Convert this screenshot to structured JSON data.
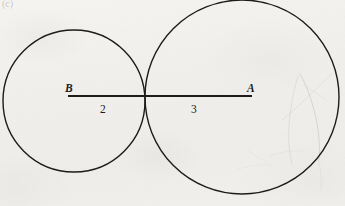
{
  "figure": {
    "corner_mark": "(c)",
    "background_color": "#f3f2ef",
    "ink_color": "#1c1c1c",
    "labels": {
      "point_b": "B",
      "point_a": "A",
      "length_left": "2",
      "length_right": "3"
    }
  },
  "chart_data": {
    "type": "diagram",
    "xlabel": "",
    "ylabel": "",
    "units": "pixels",
    "canvas": {
      "width": 345,
      "height": 206
    },
    "grid": false,
    "legend": null,
    "shapes": [
      {
        "name": "left-circle",
        "kind": "circle",
        "center": [
          74,
          101
        ],
        "radius": 71,
        "stroke": "#1c1c1c",
        "stroke_width": 1.4,
        "fill": "none",
        "label": "B",
        "labeled_radius_value": 2
      },
      {
        "name": "right-circle",
        "kind": "circle",
        "center": [
          242,
          97
        ],
        "radius": 97,
        "stroke": "#1c1c1c",
        "stroke_width": 1.4,
        "fill": "none",
        "label": "A",
        "labeled_radius_value": 3
      },
      {
        "name": "center-segment",
        "kind": "line",
        "from": [
          68,
          96
        ],
        "to": [
          252,
          96
        ],
        "stroke": "#1c1c1c",
        "stroke_width": 1.8
      }
    ],
    "points": [
      {
        "name": "B",
        "label": "B",
        "at": [
          70,
          96
        ],
        "label_offset": [
          -4,
          -12
        ]
      },
      {
        "name": "A",
        "label": "A",
        "at": [
          252,
          96
        ],
        "label_offset": [
          -4,
          -12
        ]
      },
      {
        "name": "tangent-point",
        "label": "",
        "at": [
          145,
          96
        ]
      }
    ],
    "annotations": [
      {
        "name": "left-radius-length",
        "text": "2",
        "at": [
          104,
          110
        ],
        "describes": "radius of left circle B"
      },
      {
        "name": "right-radius-length",
        "text": "3",
        "at": [
          195,
          110
        ],
        "describes": "radius of right circle A"
      }
    ]
  }
}
